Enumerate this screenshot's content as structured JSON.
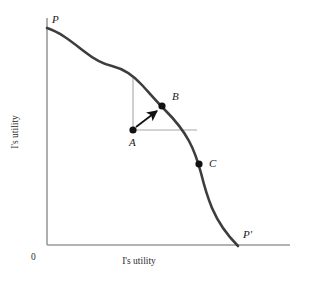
{
  "figure": {
    "background_color": "#ffffff",
    "width": 314,
    "height": 282
  },
  "axes": {
    "x_label": "I's utility",
    "y_label": "I's utility",
    "origin_label": "0",
    "axis_color": "#9a9a9a",
    "x_axis": {
      "x1": 47,
      "y1": 245,
      "x2": 290,
      "y2": 245
    },
    "y_axis": {
      "x1": 47,
      "y1": 18,
      "x2": 47,
      "y2": 245
    }
  },
  "curve": {
    "name": "utility-possibility-frontier",
    "color": "#3d3d3d",
    "stroke_width": 2.6,
    "start_label": "P",
    "end_label": "P'",
    "start_point": {
      "x": 47,
      "y": 28
    },
    "end_point": {
      "x": 238,
      "y": 246
    },
    "path": "M 47,28 C 60,32 72,42 85,52 C 95,60 103,64 112,66 C 124,69 133,75 142,85 C 152,96 158,103 165,110 C 174,119 182,128 189,141 C 195,152 198,162 201,173 C 204,185 207,196 212,208 C 218,222 226,234 238,246"
  },
  "labels": {
    "P": {
      "text": "P",
      "x": 52,
      "y": 23
    },
    "P_prime": {
      "text": "P'",
      "x": 243,
      "y": 238
    },
    "A": {
      "text": "A",
      "x": 129,
      "y": 146
    },
    "B": {
      "text": "B",
      "x": 172,
      "y": 100
    },
    "C": {
      "text": "C",
      "x": 209,
      "y": 167
    }
  },
  "points": [
    {
      "id": "A",
      "label": "A",
      "x": 133,
      "y": 130,
      "radius": 3.6,
      "color": "#111111"
    },
    {
      "id": "B",
      "label": "B",
      "x": 162,
      "y": 106,
      "radius": 3.6,
      "color": "#111111"
    },
    {
      "id": "C",
      "label": "C",
      "x": 199,
      "y": 164,
      "radius": 3.6,
      "color": "#111111"
    }
  ],
  "guide_lines": {
    "color": "#a8a8a8",
    "stroke_width": 1.1,
    "vertical": {
      "x1": 133,
      "y1": 130,
      "x2": 133,
      "y2": 78
    },
    "horizontal": {
      "x1": 133,
      "y1": 130,
      "x2": 197,
      "y2": 130
    }
  },
  "arrow": {
    "name": "improvement-arrow",
    "color": "#111111",
    "stroke_width": 1.8,
    "from": {
      "x": 136,
      "y": 127
    },
    "to": {
      "x": 158,
      "y": 110
    }
  }
}
